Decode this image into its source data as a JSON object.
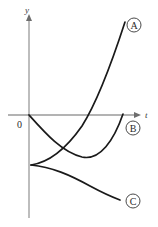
{
  "figure": {
    "kind": "math-graph",
    "background_color": "#ffffff",
    "curve_color": "#1a1a1a",
    "axis_color": "#9a9a9a",
    "label_color": "#2a2a2a"
  },
  "axes": {
    "x_axis": {
      "name": "t-axis",
      "label": "t",
      "label_x": 145,
      "label_y": 116,
      "line_x1": 8,
      "line_x2": 138,
      "line_y": 115,
      "arrow": "right"
    },
    "y_axis": {
      "name": "y-axis",
      "label": "y",
      "label_x": 27,
      "label_y": 12,
      "line_x": 29,
      "line_y1": 18,
      "line_y2": 218,
      "arrow": "up"
    },
    "origin": {
      "label": "0",
      "x": 29,
      "y": 115,
      "label_x": 19,
      "label_y": 127
    }
  },
  "chart_data": {
    "type": "line",
    "title": "",
    "xlabel": "t",
    "ylabel": "y",
    "grid": false,
    "legend": "inline-badges",
    "series": [
      {
        "name": "A",
        "badge": "A",
        "badge_x": 134,
        "badge_y": 25,
        "badge_r": 7,
        "description": "increasing convex curve rising from below the axis steeply upward",
        "path": "M 31,165 C 52,162 68,146 82,126 C 96,104 112,62 125,22",
        "points": [
          [
            31,
            165
          ],
          [
            46,
            161
          ],
          [
            60,
            152
          ],
          [
            72,
            140
          ],
          [
            84,
            123
          ],
          [
            95,
            104
          ],
          [
            106,
            79
          ],
          [
            116,
            51
          ],
          [
            125,
            22
          ]
        ]
      },
      {
        "name": "B",
        "badge": "B",
        "badge_x": 133,
        "badge_y": 128,
        "badge_r": 7,
        "description": "U-shaped curve starting at the origin, dipping to a minimum then rising back to the axis",
        "path": "M 29,115 C 46,134 62,152 82,157 C 100,161 114,140 123,114",
        "points": [
          [
            29,
            115
          ],
          [
            41,
            129
          ],
          [
            53,
            141
          ],
          [
            66,
            150
          ],
          [
            78,
            156
          ],
          [
            88,
            157
          ],
          [
            98,
            152
          ],
          [
            108,
            141
          ],
          [
            116,
            129
          ],
          [
            123,
            114
          ]
        ]
      },
      {
        "name": "C",
        "badge": "C",
        "badge_x": 133,
        "badge_y": 201,
        "badge_r": 7,
        "description": "decreasing concave curve falling away below the starting point",
        "path": "M 31,165 C 52,167 70,175 90,186 C 103,193 112,197 120,200",
        "points": [
          [
            31,
            165
          ],
          [
            44,
            166
          ],
          [
            57,
            169
          ],
          [
            69,
            174
          ],
          [
            81,
            180
          ],
          [
            92,
            187
          ],
          [
            103,
            193
          ],
          [
            112,
            197
          ],
          [
            120,
            200
          ]
        ]
      }
    ],
    "branch_point": {
      "x": 31,
      "y": 165,
      "description": "common left endpoint of curves A and C"
    }
  }
}
